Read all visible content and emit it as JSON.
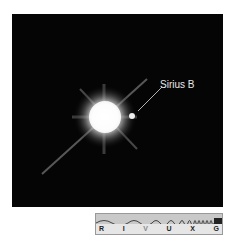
{
  "image": {
    "subject": "Sirius A and Sirius B",
    "annotation": "Sirius B"
  },
  "wavelength_bar": {
    "bands": [
      "R",
      "I",
      "V",
      "U",
      "X",
      "G"
    ],
    "highlighted": "V"
  }
}
